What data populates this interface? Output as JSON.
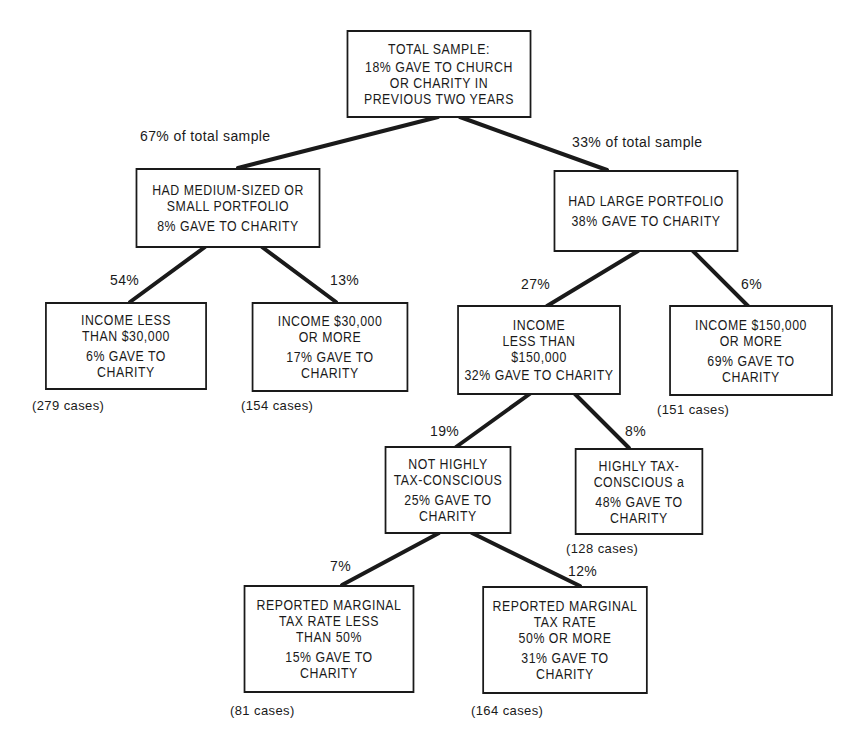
{
  "diagram": {
    "type": "decision-tree",
    "nodes": {
      "root": {
        "title": "TOTAL SAMPLE:",
        "stat": "18% GAVE TO CHURCH\nOR CHARITY IN\nPREVIOUS TWO YEARS"
      },
      "medium_small": {
        "title": "HAD MEDIUM-SIZED OR\nSMALL PORTFOLIO",
        "stat": "8% GAVE TO CHARITY"
      },
      "large": {
        "title": "HAD LARGE PORTFOLIO",
        "stat": "38% GAVE TO CHARITY"
      },
      "inc_lt_30k": {
        "title": "INCOME LESS\nTHAN $30,000",
        "stat": "6% GAVE TO\nCHARITY",
        "cases": "(279 cases)"
      },
      "inc_ge_30k": {
        "title": "INCOME $30,000\nOR MORE",
        "stat": "17% GAVE TO\nCHARITY",
        "cases": "(154 cases)"
      },
      "inc_lt_150k": {
        "title": "INCOME\nLESS THAN\n$150,000",
        "stat": "32% GAVE TO CHARITY"
      },
      "inc_ge_150k": {
        "title": "INCOME $150,000\nOR MORE",
        "stat": "69% GAVE TO\nCHARITY",
        "cases": "(151 cases)"
      },
      "not_tax_conscious": {
        "title": "NOT HIGHLY\nTAX-CONSCIOUS",
        "stat": "25% GAVE TO\nCHARITY"
      },
      "tax_conscious": {
        "title": "HIGHLY TAX-\nCONSCIOUS a",
        "stat": "48% GAVE TO\nCHARITY",
        "cases": "(128 cases)"
      },
      "rate_lt_50": {
        "title": "REPORTED MARGINAL\nTAX RATE LESS\nTHAN 50%",
        "stat": "15% GAVE TO\nCHARITY",
        "cases": "(81 cases)"
      },
      "rate_ge_50": {
        "title": "REPORTED MARGINAL\nTAX RATE\n50% OR MORE",
        "stat": "31% GAVE TO\nCHARITY",
        "cases": "(164 cases)"
      }
    },
    "edges": {
      "root_to_medium_small": "67% of total sample",
      "root_to_large": "33% of total sample",
      "medium_small_to_inc_lt_30k": "54%",
      "medium_small_to_inc_ge_30k": "13%",
      "large_to_inc_lt_150k": "27%",
      "large_to_inc_ge_150k": "6%",
      "inc_lt_150k_to_not_tax_conscious": "19%",
      "inc_lt_150k_to_tax_conscious": "8%",
      "not_tax_conscious_to_rate_lt_50": "7%",
      "not_tax_conscious_to_rate_ge_50": "12%"
    },
    "colors": {
      "ink": "#1a1a1a",
      "background": "#ffffff"
    }
  }
}
